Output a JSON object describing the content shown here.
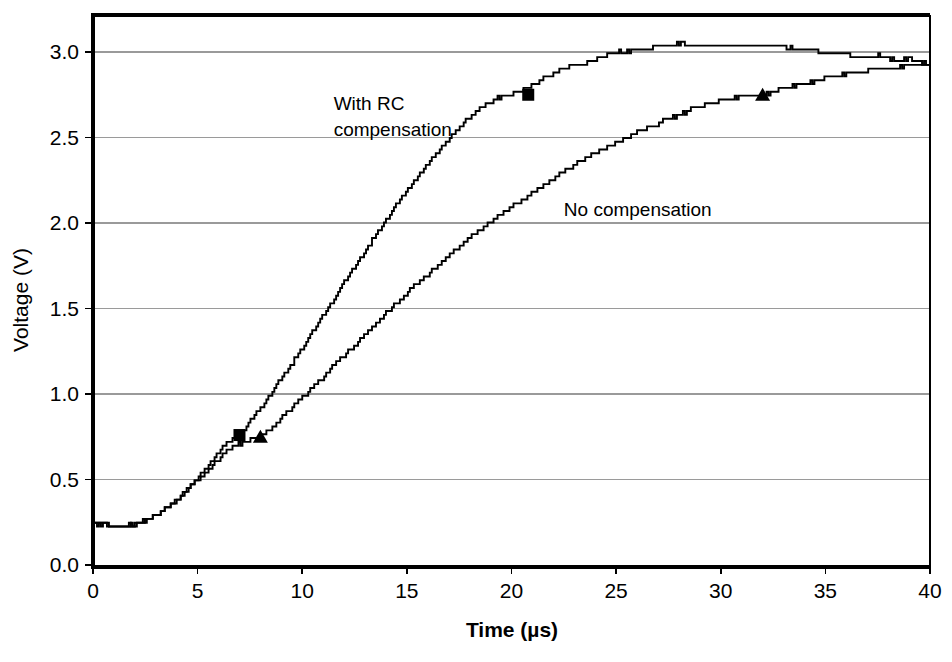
{
  "chart_data": {
    "type": "line",
    "title": "",
    "xlabel": "Time (µs)",
    "ylabel": "Voltage (V)",
    "xlim": [
      0,
      40
    ],
    "ylim": [
      0.0,
      3.25
    ],
    "grid": true,
    "grid_axis": "y",
    "legend": "inline-annotations",
    "x_ticks": [
      0,
      5,
      10,
      15,
      20,
      25,
      30,
      35,
      40
    ],
    "x_tick_labels": [
      "0",
      "5",
      "10",
      "15",
      "20",
      "25",
      "30",
      "35",
      "40"
    ],
    "y_ticks": [
      0.0,
      0.5,
      1.0,
      1.5,
      2.0,
      2.5,
      3.0
    ],
    "y_tick_labels": [
      "0.0",
      "0.5",
      "1.0",
      "1.5",
      "2.0",
      "2.5",
      "3.0"
    ],
    "series": [
      {
        "name": "With RC compensation",
        "marker": "square",
        "color": "#000000",
        "marker_points": [
          {
            "x": 7.0,
            "y": 0.76
          },
          {
            "x": 20.8,
            "y": 2.75
          }
        ],
        "x": [
          0.0,
          0.5,
          1.0,
          1.5,
          2.0,
          2.5,
          3.0,
          3.5,
          4.0,
          4.5,
          5.0,
          5.5,
          6.0,
          6.5,
          7.0,
          7.5,
          8.0,
          8.5,
          9.0,
          9.5,
          10.0,
          10.5,
          11.0,
          11.5,
          12.0,
          12.5,
          13.0,
          13.5,
          14.0,
          14.5,
          15.0,
          15.5,
          16.0,
          16.5,
          17.0,
          17.5,
          18.0,
          18.5,
          19.0,
          19.5,
          20.0,
          20.5,
          21.0,
          21.5,
          22.0,
          22.5,
          23.0,
          23.5,
          24.0,
          24.5,
          25.0,
          25.5,
          26.0,
          26.5,
          27.0,
          27.5,
          28.0,
          28.5,
          29.0,
          29.5,
          30.0,
          30.5,
          31.0,
          31.5,
          32.0,
          32.5,
          33.0,
          33.5,
          34.0,
          34.5,
          35.0,
          35.5,
          36.0,
          36.5,
          37.0,
          37.5,
          38.0,
          38.5,
          39.0,
          39.5,
          40.0
        ],
        "y": [
          0.24,
          0.24,
          0.23,
          0.23,
          0.24,
          0.26,
          0.29,
          0.33,
          0.38,
          0.44,
          0.51,
          0.58,
          0.66,
          0.72,
          0.76,
          0.84,
          0.92,
          1.0,
          1.09,
          1.18,
          1.27,
          1.37,
          1.46,
          1.56,
          1.65,
          1.75,
          1.84,
          1.93,
          2.02,
          2.11,
          2.19,
          2.27,
          2.35,
          2.42,
          2.49,
          2.56,
          2.62,
          2.67,
          2.71,
          2.74,
          2.75,
          2.78,
          2.81,
          2.84,
          2.87,
          2.9,
          2.92,
          2.94,
          2.96,
          2.98,
          3.0,
          3.0,
          3.02,
          3.01,
          3.04,
          3.03,
          3.05,
          3.04,
          3.04,
          3.04,
          3.04,
          3.04,
          3.04,
          3.04,
          3.04,
          3.04,
          3.03,
          3.02,
          3.01,
          3.01,
          2.99,
          3.0,
          2.99,
          2.97,
          2.97,
          2.98,
          2.96,
          2.95,
          2.96,
          2.94,
          2.93
        ]
      },
      {
        "name": "No compensation",
        "marker": "triangle",
        "color": "#000000",
        "marker_points": [
          {
            "x": 8.0,
            "y": 0.75
          },
          {
            "x": 32.0,
            "y": 2.75
          }
        ],
        "x": [
          0.0,
          0.5,
          1.0,
          1.5,
          2.0,
          2.5,
          3.0,
          3.5,
          4.0,
          4.5,
          5.0,
          5.5,
          6.0,
          6.5,
          7.0,
          7.5,
          8.0,
          8.5,
          9.0,
          9.5,
          10.0,
          10.5,
          11.0,
          11.5,
          12.0,
          12.5,
          13.0,
          13.5,
          14.0,
          14.5,
          15.0,
          15.5,
          16.0,
          16.5,
          17.0,
          17.5,
          18.0,
          18.5,
          19.0,
          19.5,
          20.0,
          20.5,
          21.0,
          21.5,
          22.0,
          22.5,
          23.0,
          23.5,
          24.0,
          24.5,
          25.0,
          25.5,
          26.0,
          26.5,
          27.0,
          27.5,
          28.0,
          28.5,
          29.0,
          29.5,
          30.0,
          30.5,
          31.0,
          31.5,
          32.0,
          32.5,
          33.0,
          33.5,
          34.0,
          34.5,
          35.0,
          35.5,
          36.0,
          36.5,
          37.0,
          37.5,
          38.0,
          38.5,
          39.0,
          39.5,
          40.0
        ],
        "y": [
          0.24,
          0.24,
          0.23,
          0.23,
          0.24,
          0.26,
          0.29,
          0.33,
          0.38,
          0.44,
          0.5,
          0.56,
          0.62,
          0.68,
          0.71,
          0.73,
          0.75,
          0.8,
          0.86,
          0.92,
          0.98,
          1.04,
          1.1,
          1.17,
          1.23,
          1.29,
          1.35,
          1.41,
          1.47,
          1.53,
          1.59,
          1.65,
          1.7,
          1.76,
          1.81,
          1.86,
          1.91,
          1.96,
          2.01,
          2.05,
          2.1,
          2.14,
          2.18,
          2.22,
          2.26,
          2.3,
          2.34,
          2.37,
          2.41,
          2.44,
          2.47,
          2.5,
          2.53,
          2.56,
          2.58,
          2.61,
          2.63,
          2.66,
          2.68,
          2.7,
          2.72,
          2.73,
          2.74,
          2.75,
          2.75,
          2.77,
          2.79,
          2.8,
          2.82,
          2.83,
          2.85,
          2.86,
          2.87,
          2.88,
          2.89,
          2.9,
          2.9,
          2.91,
          2.92,
          2.92,
          2.93
        ]
      }
    ],
    "annotations": [
      {
        "id": "with-rc",
        "lines": [
          "With RC",
          "compensation"
        ],
        "x": 11.5,
        "y": 2.66
      },
      {
        "id": "no-comp",
        "lines": [
          "No compensation"
        ],
        "x": 22.5,
        "y": 2.04
      }
    ]
  }
}
